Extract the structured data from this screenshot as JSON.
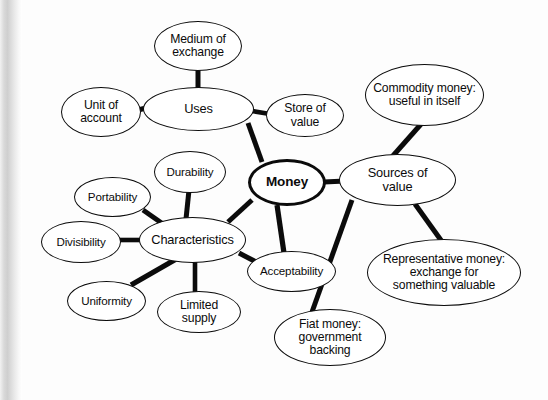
{
  "diagram": {
    "title": "Money",
    "type": "mind-map",
    "nodes": [
      {
        "id": "money",
        "label": "Money",
        "x": 248,
        "y": 159,
        "w": 78,
        "h": 47,
        "size": "lg",
        "central": true
      },
      {
        "id": "uses",
        "label": "Uses",
        "x": 143,
        "y": 87,
        "w": 111,
        "h": 44,
        "size": "md",
        "central": false
      },
      {
        "id": "medium",
        "label": "Medium of\nexchange",
        "x": 154,
        "y": 21,
        "w": 88,
        "h": 50,
        "size": "sm",
        "central": false
      },
      {
        "id": "unit",
        "label": "Unit of\naccount",
        "x": 61,
        "y": 87,
        "w": 80,
        "h": 50,
        "size": "sm",
        "central": false
      },
      {
        "id": "store",
        "label": "Store of\nvalue",
        "x": 266,
        "y": 94,
        "w": 78,
        "h": 43,
        "size": "sm",
        "central": false
      },
      {
        "id": "sources",
        "label": "Sources of\nvalue",
        "x": 339,
        "y": 154,
        "w": 117,
        "h": 52,
        "size": "md",
        "central": false
      },
      {
        "id": "commodity",
        "label": "Commodity money:\nuseful in itself",
        "x": 365,
        "y": 64,
        "w": 119,
        "h": 62,
        "size": "sm",
        "central": false
      },
      {
        "id": "representative",
        "label": "Representative money:\nexchange for\nsomething valuable",
        "x": 367,
        "y": 239,
        "w": 154,
        "h": 67,
        "size": "sm",
        "central": false
      },
      {
        "id": "fiat",
        "label": "Fiat money:\ngovernment\nbacking",
        "x": 274,
        "y": 309,
        "w": 112,
        "h": 57,
        "size": "sm",
        "central": false
      },
      {
        "id": "characteristics",
        "label": "Characteristics",
        "x": 139,
        "y": 217,
        "w": 107,
        "h": 46,
        "size": "md",
        "central": false
      },
      {
        "id": "durability",
        "label": "Durability",
        "x": 154,
        "y": 151,
        "w": 72,
        "h": 42,
        "size": "xs",
        "central": false
      },
      {
        "id": "portability",
        "label": "Portability",
        "x": 74,
        "y": 177,
        "w": 77,
        "h": 40,
        "size": "xs",
        "central": false
      },
      {
        "id": "divisibility",
        "label": "Divisibility",
        "x": 41,
        "y": 221,
        "w": 80,
        "h": 42,
        "size": "xs",
        "central": false
      },
      {
        "id": "uniformity",
        "label": "Uniformity",
        "x": 67,
        "y": 281,
        "w": 79,
        "h": 40,
        "size": "xs",
        "central": false
      },
      {
        "id": "limited",
        "label": "Limited\nsupply",
        "x": 157,
        "y": 291,
        "w": 84,
        "h": 42,
        "size": "sm",
        "central": false
      },
      {
        "id": "acceptability",
        "label": "Acceptability",
        "x": 247,
        "y": 251,
        "w": 89,
        "h": 41,
        "size": "xs",
        "central": false
      }
    ],
    "edges": [
      {
        "from": "uses",
        "to": "money",
        "x1": 248,
        "y1": 123,
        "x2": 262,
        "y2": 162,
        "width": 5.0
      },
      {
        "from": "medium",
        "to": "uses",
        "x1": 198,
        "y1": 70,
        "x2": 198,
        "y2": 88,
        "width": 5.0
      },
      {
        "from": "unit",
        "to": "uses",
        "x1": 138,
        "y1": 110,
        "x2": 150,
        "y2": 107,
        "width": 5.0
      },
      {
        "from": "uses",
        "to": "store",
        "x1": 252,
        "y1": 111,
        "x2": 270,
        "y2": 114,
        "width": 4.6
      },
      {
        "from": "money",
        "to": "sources",
        "x1": 324,
        "y1": 182,
        "x2": 345,
        "y2": 181,
        "width": 4.8
      },
      {
        "from": "commodity",
        "to": "sources",
        "x1": 422,
        "y1": 123,
        "x2": 391,
        "y2": 158,
        "width": 5.0
      },
      {
        "from": "sources",
        "to": "representative",
        "x1": 415,
        "y1": 204,
        "x2": 443,
        "y2": 243,
        "width": 5.0
      },
      {
        "from": "sources",
        "to": "fiat",
        "x1": 352,
        "y1": 200,
        "x2": 312,
        "y2": 312,
        "width": 5.0
      },
      {
        "from": "money",
        "to": "characteristics",
        "x1": 252,
        "y1": 200,
        "x2": 228,
        "y2": 222,
        "width": 5.0
      },
      {
        "from": "money",
        "to": "acceptability",
        "x1": 277,
        "y1": 205,
        "x2": 284,
        "y2": 253,
        "width": 5.2
      },
      {
        "from": "durability",
        "to": "characteristics",
        "x1": 189,
        "y1": 190,
        "x2": 186,
        "y2": 219,
        "width": 5.0
      },
      {
        "from": "portability",
        "to": "characteristics",
        "x1": 143,
        "y1": 210,
        "x2": 163,
        "y2": 224,
        "width": 5.0
      },
      {
        "from": "divisibility",
        "to": "characteristics",
        "x1": 119,
        "y1": 240,
        "x2": 141,
        "y2": 240,
        "width": 4.6
      },
      {
        "from": "uniformity",
        "to": "characteristics",
        "x1": 131,
        "y1": 285,
        "x2": 178,
        "y2": 258,
        "width": 5.2
      },
      {
        "from": "limited",
        "to": "characteristics",
        "x1": 195,
        "y1": 292,
        "x2": 195,
        "y2": 261,
        "width": 4.6
      },
      {
        "from": "characteristics",
        "to": "acceptability",
        "x1": 239,
        "y1": 253,
        "x2": 258,
        "y2": 263,
        "width": 5.0
      }
    ],
    "colors": {
      "stroke": "#0b0b0b",
      "fill": "#ffffff",
      "background": "#ffffff",
      "gutter_shadow": "#d0d0d0"
    }
  }
}
